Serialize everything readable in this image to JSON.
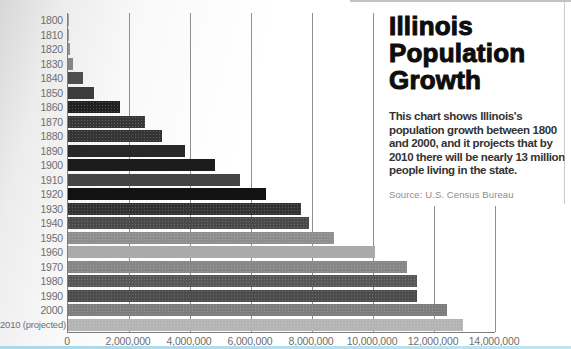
{
  "panel": {
    "title_lines": [
      "Illinois",
      "Population",
      "Growth"
    ],
    "description": "This chart shows Illinois's population growth between 1800 and 2000, and it projects that by 2010 there will be nearly 13 million people living in the state.",
    "description_lines": [
      "This chart shows Illinois's",
      "population growth between 1800",
      "and 2000, and it projects that by",
      "2010 there will be nearly 13 million",
      "people living in the state."
    ],
    "source": "Source: U.S. Census Bureau"
  },
  "chart_data": {
    "type": "bar",
    "orientation": "horizontal",
    "title": "Illinois Population Growth",
    "xlabel": "Population",
    "ylabel": "Census year",
    "xlim": [
      0,
      14000000
    ],
    "grid": true,
    "legend": false,
    "source": "U.S. Census Bureau",
    "x_tick_labels": [
      "0",
      "2,000,000",
      "4,000,000",
      "6,000,000",
      "8,000,000",
      "10,000,000",
      "12,000,000",
      "14,000,000"
    ],
    "x_tick_values": [
      0,
      2000000,
      4000000,
      6000000,
      8000000,
      10000000,
      12000000,
      14000000
    ],
    "categories": [
      "1800",
      "1810",
      "1820",
      "1830",
      "1840",
      "1850",
      "1860",
      "1870",
      "1880",
      "1890",
      "1900",
      "1910",
      "1920",
      "1930",
      "1940",
      "1950",
      "1960",
      "1970",
      "1980",
      "1990",
      "2000",
      "2010 (projected)"
    ],
    "values": [
      2458,
      12282,
      55211,
      157445,
      476183,
      851470,
      1711951,
      2539891,
      3077871,
      3826352,
      4821550,
      5638591,
      6485280,
      7630654,
      7897241,
      8712176,
      10081158,
      11113976,
      11426518,
      11430602,
      12419293,
      12960000
    ],
    "bar_colors": [
      "#a2a2a2",
      "#9a9a9a",
      "#929292",
      "#858585",
      "#4e4e4e",
      "#3c3c3c",
      "#212121",
      "#373737",
      "#343434",
      "#282828",
      "#1c1c1c",
      "#444444",
      "#121212",
      "#323232",
      "#4a4a4a",
      "#8e8e8e",
      "#aaaaaa",
      "#868686",
      "#575757",
      "#4c4c4c",
      "#7d7d7d",
      "#b4b4b4"
    ],
    "halftone": [
      false,
      false,
      false,
      false,
      false,
      false,
      true,
      true,
      true,
      false,
      false,
      false,
      false,
      true,
      true,
      true,
      false,
      true,
      true,
      true,
      true,
      true
    ]
  },
  "colors": {
    "gridline": "#909090",
    "axis": "#7d7d7d",
    "label_text": "#6e6e6e",
    "title_text": "#0d0d0d",
    "description_text": "#333333",
    "source_text": "#8d8d8d",
    "bottom_strip": "#aadeee"
  }
}
